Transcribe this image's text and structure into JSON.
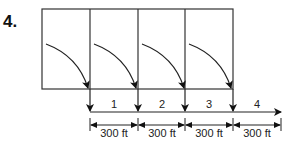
{
  "problem_number": "4.",
  "diagram": {
    "boxes": 4,
    "segments": [
      "1",
      "2",
      "3",
      "4"
    ],
    "dimensions": [
      "300 ft",
      "300 ft",
      "300 ft",
      "300 ft"
    ],
    "colors": {
      "line": "#222222",
      "box": "#333333",
      "background": "#ffffff"
    }
  }
}
